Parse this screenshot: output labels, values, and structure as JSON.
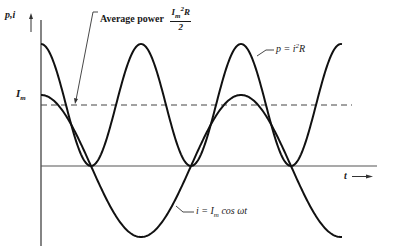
{
  "diagram": {
    "axes": {
      "y_label": "p,i",
      "x_label": "t",
      "level_label": "I",
      "level_label_sub": "m"
    },
    "annotations": {
      "average_power_text": "Average power",
      "average_power_num_base": "I",
      "average_power_num_sub": "m",
      "average_power_num_sup": "2",
      "average_power_num_tail": "R",
      "average_power_den": "2",
      "power_eq_left": "p = i",
      "power_eq_sup": "2",
      "power_eq_right": "R",
      "current_eq_left": "i = I",
      "current_eq_sub": "m",
      "current_eq_right": " cos ωt"
    },
    "colors": {
      "curve": "#111111",
      "axis": "#333333",
      "dashed": "#444444"
    }
  }
}
